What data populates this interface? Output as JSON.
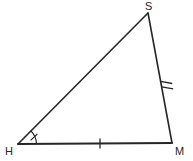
{
  "figure": {
    "type": "triangle",
    "name": "triangle-HSM",
    "background_color": "#ffffff",
    "stroke_color": "#262626",
    "label_color": "#262626",
    "canvas": {
      "width": 193,
      "height": 161
    },
    "vertices": [
      {
        "id": "H",
        "label": "H",
        "x": 18,
        "y": 144,
        "label_x": 5,
        "label_y": 146
      },
      {
        "id": "S",
        "label": "S",
        "x": 148,
        "y": 13,
        "label_x": 145,
        "label_y": 1
      },
      {
        "id": "M",
        "label": "M",
        "x": 172,
        "y": 143,
        "label_x": 175,
        "label_y": 146
      }
    ],
    "sides": [
      {
        "id": "HS",
        "from": "H",
        "to": "S",
        "stroke_width": 1.6,
        "tick_marks": 0
      },
      {
        "id": "SM",
        "from": "S",
        "to": "M",
        "stroke_width": 1.6,
        "tick_marks": 2,
        "tick_center_x": 167,
        "tick_center_y": 84
      },
      {
        "id": "HM",
        "from": "H",
        "to": "M",
        "stroke_width": 2.0,
        "tick_marks": 1,
        "tick_center_x": 100,
        "tick_center_y": 143
      }
    ],
    "angle_marks": [
      {
        "id": "angle-H",
        "at_vertex": "H",
        "arc_radius": 18,
        "tick_marks": 1,
        "stroke_width": 1.1
      }
    ]
  }
}
